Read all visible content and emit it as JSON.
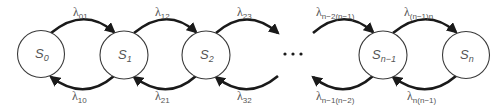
{
  "diagram": {
    "states": [
      {
        "base": "S",
        "sub": "0",
        "cx": 41
      },
      {
        "base": "S",
        "sub": "1",
        "cx": 124
      },
      {
        "base": "S",
        "sub": "2",
        "cx": 206
      },
      {
        "base": "S",
        "sub": "n−1",
        "cx": 383
      },
      {
        "base": "S",
        "sub": "n",
        "cx": 466
      }
    ],
    "ellipsis": "…",
    "forward_rates": [
      {
        "symbol": "λ",
        "sub": "01"
      },
      {
        "symbol": "λ",
        "sub": "12"
      },
      {
        "symbol": "λ",
        "sub": "23"
      },
      {
        "symbol": "λ",
        "sub": "n−2(n−1)"
      },
      {
        "symbol": "λ",
        "sub": "(n−1)n"
      }
    ],
    "backward_rates": [
      {
        "symbol": "λ",
        "sub": "10"
      },
      {
        "symbol": "λ",
        "sub": "21"
      },
      {
        "symbol": "λ",
        "sub": "32"
      },
      {
        "symbol": "λ",
        "sub": "n−1(n−2)"
      },
      {
        "symbol": "λ",
        "sub": "n(n−1)"
      }
    ],
    "colors": {
      "arc": "#1a1a1a",
      "circle_stroke": "#3a3a3a",
      "text": "#555555",
      "background": "#ffffff"
    }
  }
}
